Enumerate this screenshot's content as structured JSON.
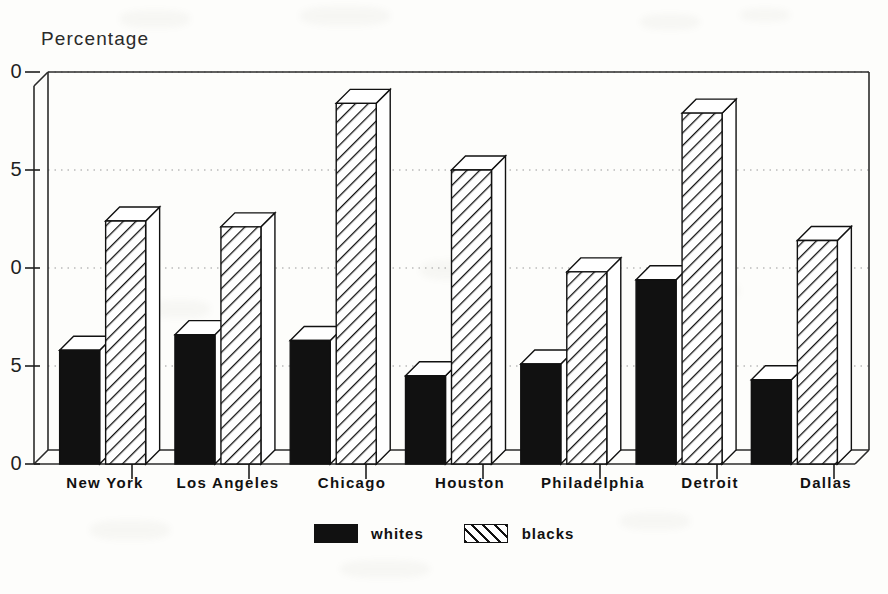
{
  "chart_data": {
    "type": "bar",
    "title": "",
    "ylabel": "Percentage",
    "xlabel": "",
    "ylim": [
      0,
      20
    ],
    "yticks": [
      0,
      5,
      10,
      15,
      20
    ],
    "ytick_labels": [
      "0",
      "5",
      "0",
      "5",
      "0"
    ],
    "ytick_labels_note": "left digits clipped off page edge; true values 0,5,10,15,20",
    "grid": "horizontal dotted at 5,10,15,20",
    "legend_position": "bottom-center",
    "categories": [
      "New York",
      "Los Angeles",
      "Chicago",
      "Houston",
      "Philadelphia",
      "Detroit",
      "Dallas"
    ],
    "series": [
      {
        "name": "whites",
        "style": "solid-black",
        "values": [
          5.8,
          6.6,
          6.3,
          4.5,
          5.1,
          9.4,
          4.3
        ]
      },
      {
        "name": "blacks",
        "style": "diagonal-hatch",
        "values": [
          12.4,
          12.1,
          18.4,
          15.0,
          9.8,
          17.9,
          11.4
        ]
      }
    ]
  },
  "axis": {
    "title": "Percentage"
  },
  "legend": {
    "items": [
      {
        "label": "whites",
        "swatch": "solid-black-swatch"
      },
      {
        "label": "blacks",
        "swatch": "hatched-swatch"
      }
    ]
  },
  "colors": {
    "ink": "#111111",
    "paper": "#fdfdfb",
    "grid": "#9a9a9a"
  }
}
